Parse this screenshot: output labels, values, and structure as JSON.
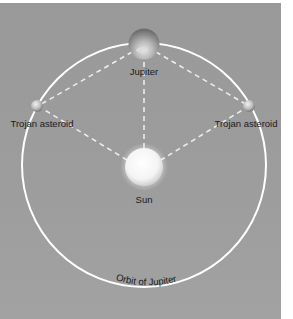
{
  "diagram": {
    "labels": {
      "jupiter": "Jupiter",
      "trojan_left": "Trojan asteroid",
      "trojan_right": "Trojan asteroid",
      "sun": "Sun",
      "orbit": "Orbit of Jupiter"
    },
    "colors": {
      "background": "#9a9a9a",
      "orbit": "#ffffff",
      "dashed_lines": "#e8e8e8",
      "text": "#1a1a1a"
    }
  }
}
